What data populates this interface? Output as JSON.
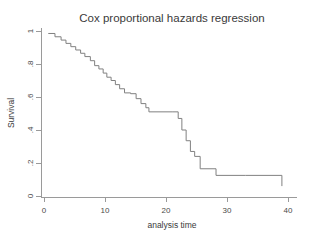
{
  "chart_data": {
    "type": "line",
    "subtype": "step-survival",
    "title": "Cox proportional hazards regression",
    "xlabel": "analysis time",
    "ylabel": "Survival",
    "xlim": [
      0,
      40
    ],
    "ylim": [
      0,
      1
    ],
    "xticks": [
      0,
      10,
      20,
      30,
      40
    ],
    "xtick_labels": [
      "0",
      "10",
      "20",
      "30",
      "40"
    ],
    "yticks": [
      0,
      0.2,
      0.4,
      0.6,
      0.8,
      1
    ],
    "ytick_labels": [
      "0",
      ".2",
      ".4",
      ".6",
      ".8",
      "1"
    ],
    "grid": false,
    "legend": false,
    "line_color": "#808080",
    "axis_color": "#9a9a9a",
    "text_color": "#3a3a3a",
    "background": "#ffffff",
    "series": [
      {
        "name": "Survival",
        "step": "post",
        "x": [
          0.7,
          1.8,
          2.8,
          3.6,
          4.4,
          5.2,
          6.0,
          6.7,
          7.6,
          8.3,
          9.0,
          9.7,
          10.3,
          11.0,
          11.7,
          12.4,
          13.2,
          14.2,
          15.1,
          15.9,
          16.7,
          17.2,
          21.0,
          22.0,
          22.6,
          23.3,
          24.0,
          24.7,
          25.6,
          28.2,
          33.0,
          39.0
        ],
        "y": [
          0.985,
          0.965,
          0.945,
          0.925,
          0.905,
          0.885,
          0.865,
          0.845,
          0.82,
          0.79,
          0.77,
          0.745,
          0.72,
          0.7,
          0.675,
          0.65,
          0.625,
          0.62,
          0.59,
          0.56,
          0.535,
          0.51,
          0.51,
          0.47,
          0.4,
          0.335,
          0.27,
          0.24,
          0.165,
          0.125,
          0.125,
          0.06
        ]
      }
    ]
  },
  "figure": {
    "title": "Cox proportional hazards regression",
    "xlabel": "analysis time",
    "ylabel": "Survival"
  }
}
